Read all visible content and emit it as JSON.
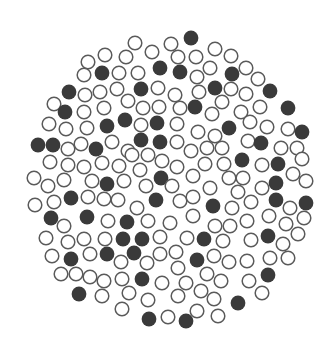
{
  "figure": {
    "description": "Circular cluster of equal-sized discs; some filled dark, others outlined",
    "width": 325,
    "height": 340,
    "disc_radius": 6.8,
    "colors": {
      "background": "#ffffff",
      "filled": "#3a3a3a",
      "outline": "#5a5a5a"
    },
    "discs": [
      [
        191,
        38,
        1
      ],
      [
        135,
        43,
        0
      ],
      [
        171,
        44,
        0
      ],
      [
        152,
        52,
        0
      ],
      [
        215,
        49,
        0
      ],
      [
        105,
        55,
        0
      ],
      [
        126,
        57,
        0
      ],
      [
        178,
        57,
        0
      ],
      [
        196,
        57,
        0
      ],
      [
        231,
        56,
        0
      ],
      [
        88,
        62,
        0
      ],
      [
        160,
        68,
        1
      ],
      [
        180,
        72,
        1
      ],
      [
        210,
        68,
        0
      ],
      [
        246,
        68,
        0
      ],
      [
        84,
        75,
        0
      ],
      [
        102,
        73,
        1
      ],
      [
        119,
        73,
        0
      ],
      [
        138,
        73,
        0
      ],
      [
        232,
        74,
        1
      ],
      [
        197,
        77,
        0
      ],
      [
        258,
        79,
        0
      ],
      [
        69,
        92,
        1
      ],
      [
        85,
        95,
        0
      ],
      [
        100,
        92,
        0
      ],
      [
        117,
        89,
        0
      ],
      [
        141,
        89,
        1
      ],
      [
        158,
        88,
        0
      ],
      [
        175,
        95,
        0
      ],
      [
        199,
        92,
        0
      ],
      [
        215,
        88,
        1
      ],
      [
        231,
        89,
        0
      ],
      [
        246,
        94,
        0
      ],
      [
        270,
        91,
        1
      ],
      [
        54,
        104,
        0
      ],
      [
        65,
        112,
        1
      ],
      [
        84,
        112,
        0
      ],
      [
        104,
        108,
        0
      ],
      [
        128,
        101,
        0
      ],
      [
        143,
        108,
        0
      ],
      [
        159,
        107,
        0
      ],
      [
        180,
        108,
        0
      ],
      [
        195,
        107,
        1
      ],
      [
        222,
        102,
        0
      ],
      [
        212,
        114,
        0
      ],
      [
        241,
        112,
        0
      ],
      [
        260,
        107,
        0
      ],
      [
        288,
        108,
        1
      ],
      [
        49,
        124,
        0
      ],
      [
        66,
        129,
        0
      ],
      [
        87,
        128,
        0
      ],
      [
        107,
        126,
        1
      ],
      [
        125,
        120,
        1
      ],
      [
        141,
        125,
        0
      ],
      [
        157,
        123,
        1
      ],
      [
        177,
        124,
        0
      ],
      [
        198,
        132,
        0
      ],
      [
        215,
        136,
        0
      ],
      [
        229,
        128,
        1
      ],
      [
        250,
        122,
        0
      ],
      [
        267,
        127,
        0
      ],
      [
        288,
        129,
        0
      ],
      [
        302,
        132,
        1
      ],
      [
        38,
        145,
        1
      ],
      [
        53,
        145,
        1
      ],
      [
        68,
        149,
        0
      ],
      [
        81,
        144,
        0
      ],
      [
        96,
        149,
        1
      ],
      [
        112,
        142,
        0
      ],
      [
        128,
        151,
        0
      ],
      [
        141,
        140,
        1
      ],
      [
        160,
        142,
        1
      ],
      [
        177,
        142,
        0
      ],
      [
        191,
        151,
        0
      ],
      [
        207,
        148,
        0
      ],
      [
        222,
        148,
        0
      ],
      [
        248,
        141,
        0
      ],
      [
        261,
        143,
        1
      ],
      [
        281,
        148,
        0
      ],
      [
        297,
        148,
        0
      ],
      [
        50,
        162,
        0
      ],
      [
        68,
        165,
        0
      ],
      [
        84,
        167,
        0
      ],
      [
        102,
        163,
        0
      ],
      [
        119,
        166,
        0
      ],
      [
        132,
        155,
        0
      ],
      [
        140,
        170,
        0
      ],
      [
        148,
        155,
        0
      ],
      [
        162,
        161,
        0
      ],
      [
        177,
        167,
        0
      ],
      [
        205,
        164,
        0
      ],
      [
        224,
        164,
        0
      ],
      [
        242,
        160,
        1
      ],
      [
        262,
        165,
        0
      ],
      [
        278,
        164,
        1
      ],
      [
        302,
        159,
        0
      ],
      [
        34,
        178,
        0
      ],
      [
        48,
        186,
        0
      ],
      [
        64,
        180,
        0
      ],
      [
        92,
        181,
        0
      ],
      [
        107,
        184,
        1
      ],
      [
        124,
        181,
        0
      ],
      [
        146,
        186,
        0
      ],
      [
        161,
        178,
        1
      ],
      [
        172,
        186,
        0
      ],
      [
        193,
        176,
        0
      ],
      [
        210,
        188,
        0
      ],
      [
        229,
        178,
        0
      ],
      [
        243,
        178,
        0
      ],
      [
        238,
        192,
        0
      ],
      [
        262,
        188,
        0
      ],
      [
        276,
        183,
        1
      ],
      [
        293,
        174,
        0
      ],
      [
        306,
        181,
        0
      ],
      [
        35,
        205,
        0
      ],
      [
        54,
        202,
        0
      ],
      [
        71,
        198,
        1
      ],
      [
        88,
        197,
        0
      ],
      [
        104,
        199,
        0
      ],
      [
        118,
        200,
        0
      ],
      [
        137,
        208,
        0
      ],
      [
        156,
        200,
        1
      ],
      [
        180,
        201,
        0
      ],
      [
        193,
        197,
        0
      ],
      [
        213,
        206,
        1
      ],
      [
        232,
        208,
        0
      ],
      [
        251,
        202,
        0
      ],
      [
        276,
        200,
        1
      ],
      [
        290,
        208,
        0
      ],
      [
        306,
        203,
        1
      ],
      [
        51,
        218,
        1
      ],
      [
        64,
        226,
        0
      ],
      [
        87,
        217,
        1
      ],
      [
        108,
        221,
        0
      ],
      [
        127,
        222,
        1
      ],
      [
        148,
        221,
        0
      ],
      [
        170,
        223,
        0
      ],
      [
        193,
        216,
        0
      ],
      [
        215,
        226,
        0
      ],
      [
        230,
        226,
        0
      ],
      [
        247,
        221,
        0
      ],
      [
        269,
        216,
        0
      ],
      [
        286,
        224,
        0
      ],
      [
        304,
        218,
        0
      ],
      [
        46,
        238,
        0
      ],
      [
        68,
        242,
        0
      ],
      [
        84,
        239,
        0
      ],
      [
        105,
        239,
        0
      ],
      [
        123,
        239,
        1
      ],
      [
        142,
        239,
        1
      ],
      [
        160,
        237,
        0
      ],
      [
        187,
        238,
        0
      ],
      [
        204,
        239,
        1
      ],
      [
        223,
        241,
        0
      ],
      [
        251,
        240,
        0
      ],
      [
        268,
        236,
        1
      ],
      [
        283,
        244,
        0
      ],
      [
        298,
        234,
        0
      ],
      [
        52,
        256,
        0
      ],
      [
        71,
        259,
        1
      ],
      [
        90,
        254,
        0
      ],
      [
        107,
        254,
        1
      ],
      [
        121,
        262,
        0
      ],
      [
        134,
        253,
        1
      ],
      [
        147,
        263,
        0
      ],
      [
        160,
        254,
        0
      ],
      [
        176,
        252,
        0
      ],
      [
        197,
        260,
        1
      ],
      [
        214,
        256,
        0
      ],
      [
        229,
        262,
        0
      ],
      [
        247,
        261,
        0
      ],
      [
        270,
        258,
        0
      ],
      [
        288,
        258,
        0
      ],
      [
        178,
        268,
        0
      ],
      [
        61,
        274,
        0
      ],
      [
        76,
        274,
        0
      ],
      [
        90,
        277,
        0
      ],
      [
        104,
        281,
        0
      ],
      [
        122,
        279,
        0
      ],
      [
        142,
        279,
        1
      ],
      [
        162,
        283,
        0
      ],
      [
        186,
        283,
        0
      ],
      [
        207,
        274,
        0
      ],
      [
        221,
        281,
        0
      ],
      [
        249,
        281,
        0
      ],
      [
        268,
        275,
        1
      ],
      [
        79,
        294,
        1
      ],
      [
        102,
        296,
        0
      ],
      [
        129,
        293,
        0
      ],
      [
        148,
        300,
        0
      ],
      [
        178,
        296,
        0
      ],
      [
        201,
        291,
        0
      ],
      [
        214,
        299,
        0
      ],
      [
        262,
        293,
        0
      ],
      [
        238,
        303,
        1
      ],
      [
        122,
        309,
        0
      ],
      [
        149,
        319,
        1
      ],
      [
        168,
        317,
        0
      ],
      [
        186,
        321,
        1
      ],
      [
        197,
        311,
        0
      ],
      [
        218,
        316,
        0
      ]
    ]
  }
}
